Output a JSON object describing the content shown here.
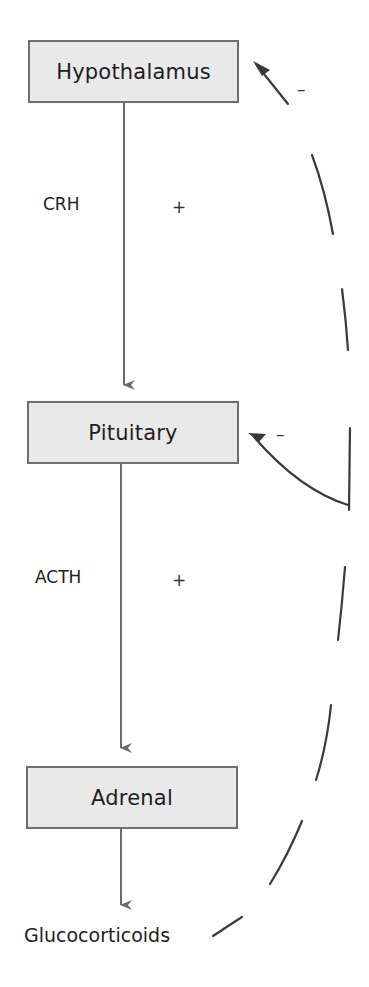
{
  "diagram": {
    "nodes": [
      {
        "id": "hypothalamus",
        "label": "Hypothalamus"
      },
      {
        "id": "pituitary",
        "label": "Pituitary"
      },
      {
        "id": "adrenal",
        "label": "Adrenal"
      }
    ],
    "output": {
      "label": "Glucocorticoids"
    },
    "edges": [
      {
        "from": "hypothalamus",
        "to": "pituitary",
        "hormone": "CRH",
        "sign": "+"
      },
      {
        "from": "pituitary",
        "to": "adrenal",
        "hormone": "ACTH",
        "sign": "+"
      },
      {
        "from": "adrenal",
        "to": "glucocorticoids",
        "hormone": "",
        "sign": ""
      }
    ],
    "feedback": [
      {
        "from": "glucocorticoids",
        "to": "hypothalamus",
        "sign": "–",
        "style": "dashed"
      },
      {
        "from": "glucocorticoids",
        "to": "pituitary",
        "sign": "–",
        "style": "dashed"
      }
    ],
    "colors": {
      "box_fill": "#e9e9e9",
      "box_border": "#6e6e6e",
      "arrow": "#6a6a6a",
      "feedback": "#3a3a3a"
    }
  }
}
